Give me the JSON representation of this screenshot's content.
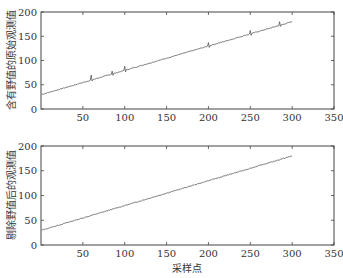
{
  "chart_data": [
    {
      "type": "line",
      "title": "",
      "xlabel": "",
      "ylabel": "含有野值的原始观测值",
      "xlim": [
        0,
        350
      ],
      "ylim": [
        0,
        200
      ],
      "xticks": [
        50,
        100,
        150,
        200,
        250,
        300,
        350
      ],
      "yticks": [
        0,
        50,
        100,
        150,
        200
      ],
      "grid": false,
      "legend": null,
      "series": [
        {
          "name": "原始观测值",
          "trend": {
            "x_start": 1,
            "y_start": 30,
            "x_end": 300,
            "y_end": 180
          },
          "outliers": [
            {
              "x": 60,
              "y": 70
            },
            {
              "x": 85,
              "y": 78
            },
            {
              "x": 100,
              "y": 88
            },
            {
              "x": 200,
              "y": 137
            },
            {
              "x": 250,
              "y": 162
            },
            {
              "x": 285,
              "y": 180
            }
          ]
        }
      ]
    },
    {
      "type": "line",
      "title": "",
      "xlabel": "采样点",
      "ylabel": "剔除野值后的观测值",
      "xlim": [
        0,
        350
      ],
      "ylim": [
        0,
        200
      ],
      "xticks": [
        50,
        100,
        150,
        200,
        250,
        300,
        350
      ],
      "yticks": [
        0,
        50,
        100,
        150,
        200
      ],
      "grid": false,
      "legend": null,
      "series": [
        {
          "name": "剔除野值后的观测值",
          "trend": {
            "x_start": 1,
            "y_start": 30,
            "x_end": 300,
            "y_end": 180
          },
          "outliers": []
        }
      ]
    }
  ],
  "top_plot": {
    "ylabel": "含有野值的原始观测值",
    "xtick_labels": [
      "50",
      "100",
      "150",
      "200",
      "250",
      "300",
      "350"
    ],
    "ytick_labels": [
      "0",
      "50",
      "100",
      "150",
      "200"
    ]
  },
  "bottom_plot": {
    "ylabel": "剔除野值后的观测值",
    "xlabel": "采样点",
    "xtick_labels": [
      "50",
      "100",
      "150",
      "200",
      "250",
      "300",
      "350"
    ],
    "ytick_labels": [
      "0",
      "50",
      "100",
      "150",
      "200"
    ]
  },
  "colors": {
    "line": "#555555",
    "axis": "#444444"
  }
}
